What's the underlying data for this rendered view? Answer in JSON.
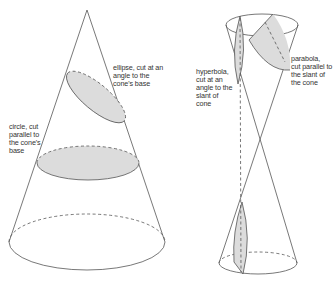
{
  "diagram": {
    "colors": {
      "line": "#555555",
      "fill": "#d8d8d8",
      "background": "#ffffff"
    },
    "left_cone": {
      "apex": [
        87,
        10
      ],
      "base": {
        "cx": 87,
        "cy": 243,
        "rx": 78,
        "ry": 28
      },
      "sections": [
        {
          "type": "ellipse",
          "label_lines": [
            "ellipse, cut at an",
            "angle to the",
            "cone's base"
          ]
        },
        {
          "type": "circle",
          "label_lines": [
            "circle, cut",
            "parallel to",
            "the cone's",
            "base"
          ]
        }
      ]
    },
    "right_double_cone": {
      "top_rim": {
        "cx": 262,
        "cy": 25,
        "rx": 36,
        "ry": 11
      },
      "vertex": [
        259,
        143
      ],
      "bottom_rim": {
        "cx": 258,
        "cy": 263,
        "rx": 39,
        "ry": 11
      },
      "sections": [
        {
          "type": "hyperbola",
          "label_lines": [
            "hyperbola,",
            "cut at an",
            "angle to the",
            "slant of",
            "cone"
          ]
        },
        {
          "type": "parabola",
          "label_lines": [
            "parabola,",
            "cut parallel to",
            "the slant of",
            "the cone"
          ]
        }
      ]
    }
  }
}
